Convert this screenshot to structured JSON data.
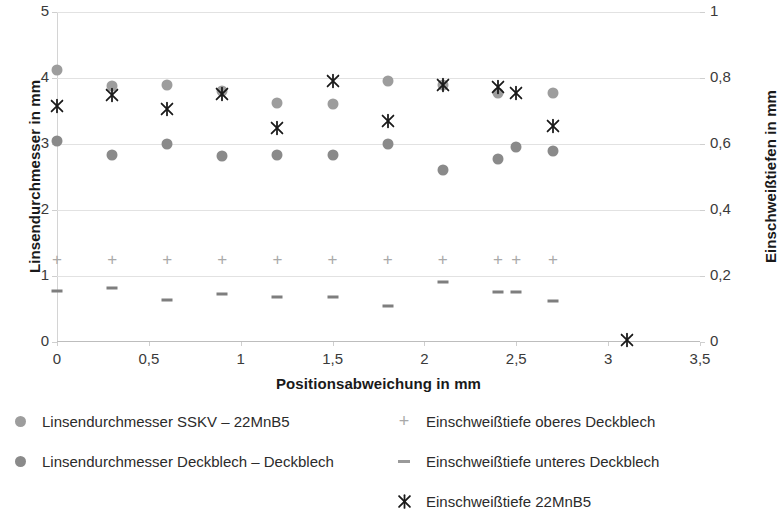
{
  "chart_data": {
    "type": "scatter",
    "title": "",
    "xlabel": "Positionsabweichung in mm",
    "ylabel": "Linsendurchmesser in mm",
    "y2label": "Einschweißtiefen in mm",
    "xlim": [
      0,
      3.5
    ],
    "ylim": [
      0,
      5
    ],
    "y2lim": [
      0,
      1
    ],
    "grid": true,
    "legend_position": "bottom",
    "xticks": [
      "0",
      "0,5",
      "1",
      "1,5",
      "2",
      "2,5",
      "3",
      "3,5"
    ],
    "xtick_values": [
      0,
      0.5,
      1,
      1.5,
      2,
      2.5,
      3,
      3.5
    ],
    "yticks": [
      "0",
      "1",
      "2",
      "3",
      "4",
      "5"
    ],
    "ytick_values": [
      0,
      1,
      2,
      3,
      4,
      5
    ],
    "y2ticks": [
      "0",
      "0,2",
      "0,4",
      "0,6",
      "0,8",
      "1"
    ],
    "y2tick_values": [
      0,
      0.2,
      0.4,
      0.6,
      0.8,
      1
    ],
    "series": [
      {
        "name": "Linsendurchmesser SSKV – 22MnB5",
        "marker": "circle",
        "color": "#9d9d9d",
        "axis": "left",
        "points": [
          {
            "x": 0.0,
            "y": 4.12
          },
          {
            "x": 0.3,
            "y": 3.88
          },
          {
            "x": 0.6,
            "y": 3.9
          },
          {
            "x": 0.9,
            "y": 3.8
          },
          {
            "x": 1.2,
            "y": 3.62
          },
          {
            "x": 1.5,
            "y": 3.6
          },
          {
            "x": 1.8,
            "y": 3.96
          },
          {
            "x": 2.1,
            "y": 3.9
          },
          {
            "x": 2.4,
            "y": 3.78
          },
          {
            "x": 2.7,
            "y": 3.78
          }
        ]
      },
      {
        "name": "Linsendurchmesser Deckblech – Deckblech",
        "marker": "circle",
        "color": "#8a8a8a",
        "axis": "left",
        "points": [
          {
            "x": 0.0,
            "y": 3.04
          },
          {
            "x": 0.3,
            "y": 2.83
          },
          {
            "x": 0.6,
            "y": 3.0
          },
          {
            "x": 0.9,
            "y": 2.82
          },
          {
            "x": 1.2,
            "y": 2.84
          },
          {
            "x": 1.5,
            "y": 2.83
          },
          {
            "x": 1.8,
            "y": 3.0
          },
          {
            "x": 2.1,
            "y": 2.6
          },
          {
            "x": 2.4,
            "y": 2.77
          },
          {
            "x": 2.5,
            "y": 2.96
          },
          {
            "x": 2.7,
            "y": 2.9
          }
        ]
      },
      {
        "name": "Einschweißtiefe oberes Deckblech",
        "marker": "plus",
        "color": "#a9a9a9",
        "axis": "right",
        "points": [
          {
            "x": 0.0,
            "y": 0.252
          },
          {
            "x": 0.3,
            "y": 0.252
          },
          {
            "x": 0.6,
            "y": 0.252
          },
          {
            "x": 0.9,
            "y": 0.252
          },
          {
            "x": 1.2,
            "y": 0.252
          },
          {
            "x": 1.5,
            "y": 0.252
          },
          {
            "x": 1.8,
            "y": 0.252
          },
          {
            "x": 2.1,
            "y": 0.252
          },
          {
            "x": 2.4,
            "y": 0.252
          },
          {
            "x": 2.5,
            "y": 0.252
          },
          {
            "x": 2.7,
            "y": 0.252
          }
        ]
      },
      {
        "name": "Einschweißtiefe unteres Deckblech",
        "marker": "dash",
        "color": "#7e7e7e",
        "axis": "right",
        "points": [
          {
            "x": 0.0,
            "y": 0.156
          },
          {
            "x": 0.3,
            "y": 0.164
          },
          {
            "x": 0.6,
            "y": 0.126
          },
          {
            "x": 0.9,
            "y": 0.146
          },
          {
            "x": 1.2,
            "y": 0.136
          },
          {
            "x": 1.5,
            "y": 0.136
          },
          {
            "x": 1.8,
            "y": 0.108
          },
          {
            "x": 2.1,
            "y": 0.182
          },
          {
            "x": 2.4,
            "y": 0.152
          },
          {
            "x": 2.5,
            "y": 0.152
          },
          {
            "x": 2.7,
            "y": 0.124
          }
        ]
      },
      {
        "name": "Einschweißtiefe 22MnB5",
        "marker": "star",
        "color": "#1a1a1a",
        "axis": "right",
        "points": [
          {
            "x": 0.0,
            "y": 0.714
          },
          {
            "x": 0.3,
            "y": 0.75
          },
          {
            "x": 0.6,
            "y": 0.706
          },
          {
            "x": 0.9,
            "y": 0.752
          },
          {
            "x": 1.2,
            "y": 0.648
          },
          {
            "x": 1.5,
            "y": 0.79
          },
          {
            "x": 1.8,
            "y": 0.67
          },
          {
            "x": 2.1,
            "y": 0.78
          },
          {
            "x": 2.4,
            "y": 0.772
          },
          {
            "x": 2.5,
            "y": 0.754
          },
          {
            "x": 2.7,
            "y": 0.656
          },
          {
            "x": 3.1,
            "y": 0.006
          }
        ]
      }
    ]
  },
  "legend": {
    "items": [
      {
        "label": "Linsendurchmesser SSKV – 22MnB5",
        "marker": "circle-light"
      },
      {
        "label": "Linsendurchmesser Deckblech – Deckblech",
        "marker": "circle-dark"
      },
      {
        "label": "Einschweißtiefe oberes Deckblech",
        "marker": "plus"
      },
      {
        "label": "Einschweißtiefe unteres Deckblech",
        "marker": "dash"
      },
      {
        "label": "Einschweißtiefe 22MnB5",
        "marker": "star"
      }
    ]
  }
}
